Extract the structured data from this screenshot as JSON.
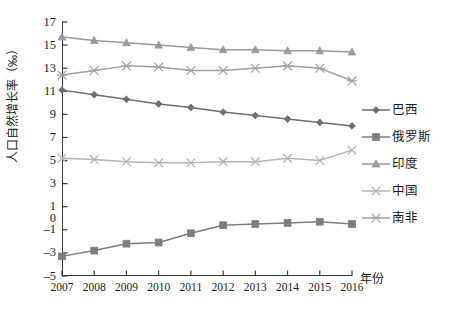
{
  "chart_data": {
    "type": "line",
    "title": "",
    "xlabel": "年份",
    "ylabel": "人口自然增长率（‰）",
    "categories": [
      "2007",
      "2008",
      "2009",
      "2010",
      "2011",
      "2012",
      "2013",
      "2014",
      "2015",
      "2016"
    ],
    "x": [
      2007,
      2008,
      2009,
      2010,
      2011,
      2012,
      2013,
      2014,
      2015,
      2016
    ],
    "ylim": [
      -5,
      17
    ],
    "xlim": [
      2007,
      2016
    ],
    "grid": false,
    "legend_position": "right",
    "y_ticks": [
      17,
      15,
      13,
      11,
      9,
      7,
      5,
      3,
      1,
      -1,
      -3,
      -5
    ],
    "y_tick_labels": [
      "17",
      "15",
      "13",
      "11",
      "9",
      "7",
      "5",
      "3",
      "1",
      "0",
      "-1",
      "-3",
      "-5"
    ],
    "series": [
      {
        "name": "巴西",
        "marker": "diamond",
        "color": "#6e6e6e",
        "values": [
          11.1,
          10.7,
          10.3,
          9.9,
          9.6,
          9.2,
          8.9,
          8.6,
          8.3,
          8.0
        ]
      },
      {
        "name": "俄罗斯",
        "marker": "square",
        "color": "#7d7d7d",
        "values": [
          -3.3,
          -2.8,
          -2.2,
          -2.1,
          -1.3,
          -0.6,
          -0.5,
          -0.4,
          -0.3,
          -0.5
        ]
      },
      {
        "name": "印度",
        "marker": "triangle",
        "color": "#9a9a9a",
        "values": [
          15.7,
          15.4,
          15.2,
          15.0,
          14.8,
          14.6,
          14.6,
          14.5,
          14.5,
          14.4
        ]
      },
      {
        "name": "中国",
        "marker": "x",
        "color": "#b4b4b4",
        "values": [
          5.2,
          5.1,
          4.9,
          4.8,
          4.8,
          4.9,
          4.9,
          5.2,
          5.0,
          5.9
        ]
      },
      {
        "name": "南非",
        "marker": "asterisk",
        "color": "#a0a0a0",
        "values": [
          12.4,
          12.8,
          13.2,
          13.1,
          12.8,
          12.8,
          13.0,
          13.2,
          13.0,
          11.9
        ]
      }
    ]
  },
  "legend": {
    "items": [
      {
        "label": "巴西",
        "marker": "diamond",
        "color": "#6e6e6e"
      },
      {
        "label": "俄罗斯",
        "marker": "square",
        "color": "#7d7d7d"
      },
      {
        "label": "印度",
        "marker": "triangle",
        "color": "#9a9a9a"
      },
      {
        "label": "中国",
        "marker": "x",
        "color": "#b4b4b4"
      },
      {
        "label": "南非",
        "marker": "asterisk",
        "color": "#a0a0a0"
      }
    ]
  },
  "axis": {
    "y_title": "人口自然增长率（‰）",
    "x_title": "年份"
  },
  "colors": {
    "axis": "#3a3a3a",
    "text": "#1c1c1c",
    "background": "#ffffff"
  }
}
